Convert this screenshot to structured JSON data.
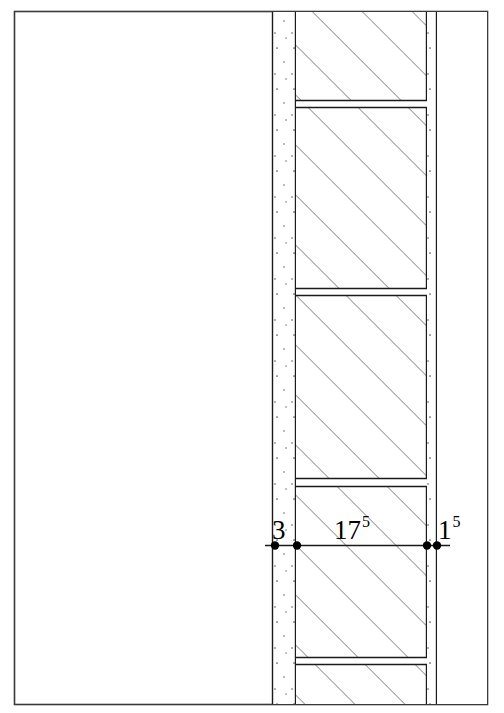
{
  "drawing": {
    "title": "Wall cross-section detail",
    "frame": {
      "x": 14,
      "y": 11,
      "width": 474,
      "height": 694,
      "stroke": "#3a3a3a",
      "fill": "#ffffff"
    },
    "colors": {
      "line": "#1a1a1a",
      "hatch": "#4a4a4a",
      "frame": "#3a3a3a",
      "speckle": "#555555",
      "background": "#ffffff"
    },
    "layers": [
      {
        "name": "plaster-layer-left",
        "x_start": 272,
        "x_end": 296,
        "pattern": "speckle"
      },
      {
        "name": "masonry-core",
        "x_start": 296,
        "x_end": 427,
        "pattern": "diagonal-hatch-45"
      },
      {
        "name": "plaster-layer-right",
        "x_start": 427,
        "x_end": 437,
        "pattern": "speckle"
      },
      {
        "name": "open-space-right",
        "x_start": 437,
        "x_end": 488,
        "pattern": "none"
      }
    ],
    "joint_bands": [
      {
        "name": "joint-band-1",
        "y_top": 100,
        "y_bottom": 108
      },
      {
        "name": "joint-band-2",
        "y_top": 288,
        "y_bottom": 296
      },
      {
        "name": "joint-band-3",
        "y_top": 478,
        "y_bottom": 487
      },
      {
        "name": "joint-band-4",
        "y_top": 657,
        "y_bottom": 665
      }
    ],
    "hatch": {
      "angle_deg": 45,
      "spacing_px": 25,
      "direction": "bottom-left-to-top-right"
    }
  },
  "dimension_line": {
    "name": "dimension-line",
    "y": 545,
    "x_start": 265,
    "x_end": 450,
    "points": [
      {
        "name": "dim-point-a",
        "x": 275
      },
      {
        "name": "dim-point-b",
        "x": 297
      },
      {
        "name": "dim-point-c",
        "x": 427
      },
      {
        "name": "dim-point-d",
        "x": 437
      }
    ],
    "labels": [
      {
        "name": "dim-label-3",
        "value": "3",
        "superscript": "",
        "numeric_value": 3,
        "spans": "dim-point-a to dim-point-b"
      },
      {
        "name": "dim-label-175",
        "value": "17",
        "superscript": "5",
        "numeric_value": 17.5,
        "spans": "dim-point-b to dim-point-c"
      },
      {
        "name": "dim-label-15",
        "value": "1",
        "superscript": "5",
        "numeric_value": 1.5,
        "spans": "dim-point-c to dim-point-d"
      }
    ]
  }
}
